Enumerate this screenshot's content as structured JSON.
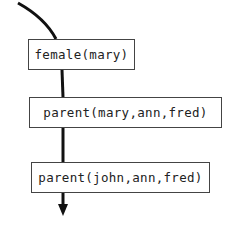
{
  "diagram": {
    "type": "goal-sequence",
    "goals": [
      {
        "label": "female(mary)"
      },
      {
        "label": "parent(mary,ann,fred)"
      },
      {
        "label": "parent(john,ann,fred)"
      }
    ],
    "colors": {
      "line": "#111111",
      "box_border": "#444444",
      "text": "#222222"
    }
  }
}
